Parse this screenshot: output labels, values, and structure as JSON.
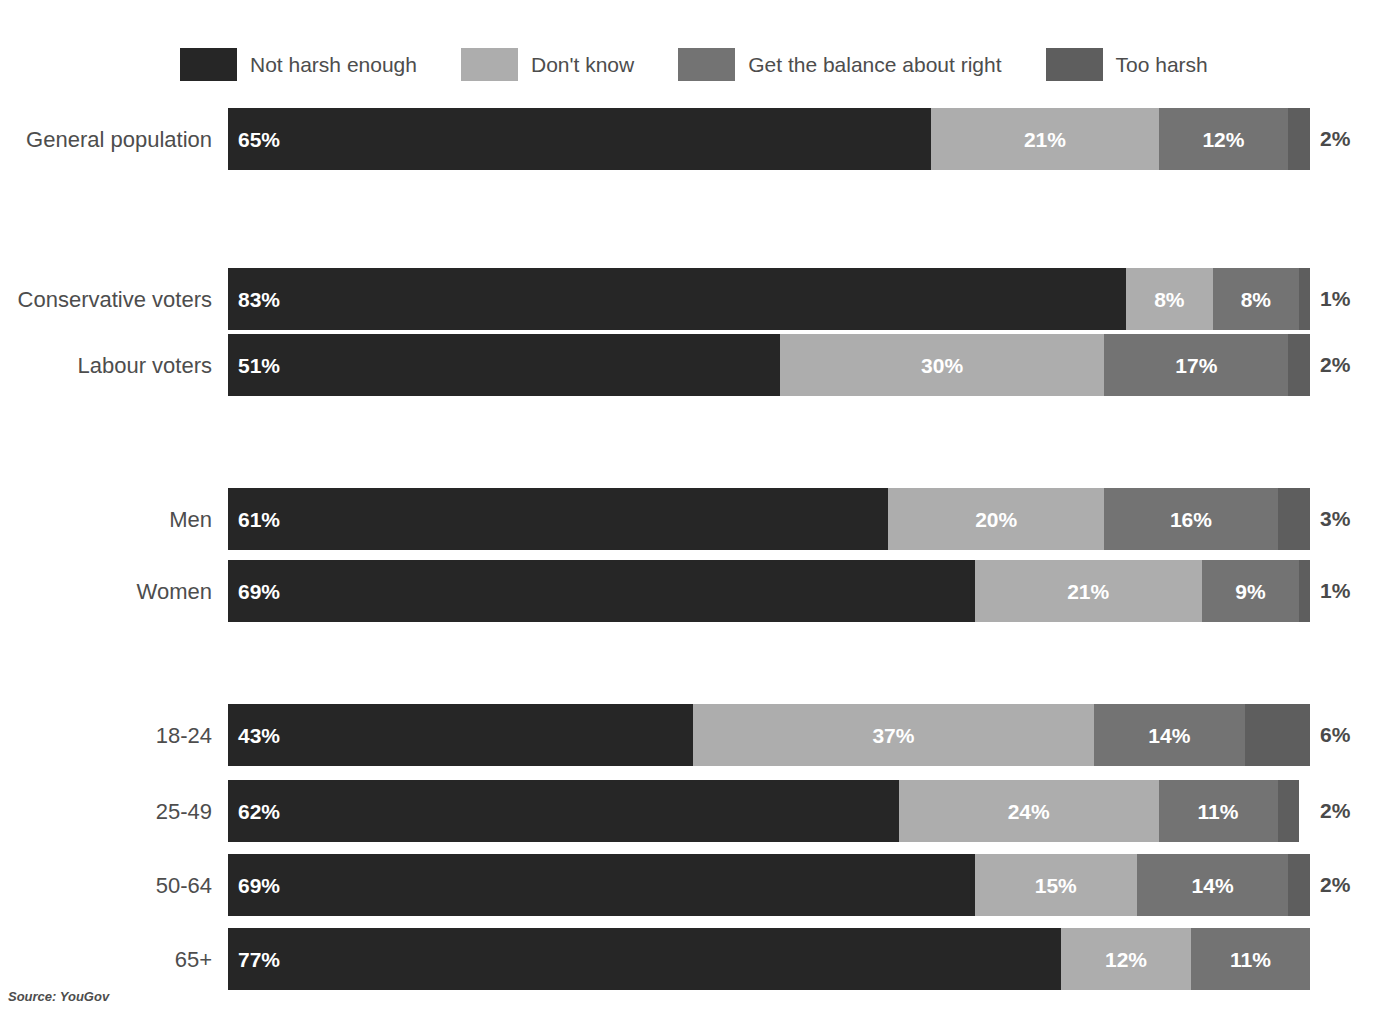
{
  "title": "",
  "source": "Source: YouGov",
  "colors": {
    "not_harsh_enough": "#262626",
    "dont_know": "#adadad",
    "get_the_balance_about_right": "#737373",
    "too_harsh": "#5e5e5e",
    "label_text": "#4d4d4d",
    "inside_label_text": "#ffffff",
    "background": "#ffffff"
  },
  "legend": {
    "items": [
      {
        "label": "Not harsh enough",
        "color": "#262626"
      },
      {
        "label": "Don't know",
        "color": "#adadad"
      },
      {
        "label": "Get the balance about right",
        "color": "#737373"
      },
      {
        "label": "Too harsh",
        "color": "#5e5e5e"
      }
    ]
  },
  "chart_data": {
    "type": "bar",
    "orientation": "horizontal",
    "stacked": true,
    "stack_mode": "percent",
    "title": "",
    "xlabel": "",
    "ylabel": "",
    "xlim": [
      0,
      100
    ],
    "grid": false,
    "legend_position": "top",
    "source": "Source: YouGov",
    "categories": [
      "General population",
      "Conservative voters",
      "Labour voters",
      "Men",
      "Women",
      "18-24",
      "25-49",
      "50-64",
      "65+"
    ],
    "series": [
      {
        "name": "Not harsh enough",
        "color": "#262626",
        "values": [
          65,
          83,
          51,
          61,
          69,
          43,
          62,
          69,
          77
        ]
      },
      {
        "name": "Don't know",
        "color": "#adadad",
        "values": [
          21,
          8,
          30,
          20,
          21,
          37,
          24,
          15,
          12
        ]
      },
      {
        "name": "Get the balance about right",
        "color": "#737373",
        "values": [
          12,
          8,
          17,
          16,
          9,
          14,
          11,
          14,
          11
        ]
      },
      {
        "name": "Too harsh",
        "color": "#5e5e5e",
        "values": [
          2,
          1,
          2,
          3,
          1,
          6,
          2,
          2,
          0
        ]
      }
    ],
    "rows": [
      {
        "category": "General population",
        "segments": [
          {
            "series": "Not harsh enough",
            "value": 65,
            "label": "65%",
            "label_inside": true
          },
          {
            "series": "Don't know",
            "value": 21,
            "label": "21%",
            "label_inside": true
          },
          {
            "series": "Get the balance about right",
            "value": 12,
            "label": "12%",
            "label_inside": true
          },
          {
            "series": "Too harsh",
            "value": 2,
            "label": "2%",
            "label_inside": false
          }
        ]
      },
      {
        "category": "Conservative voters",
        "segments": [
          {
            "series": "Not harsh enough",
            "value": 83,
            "label": "83%",
            "label_inside": true
          },
          {
            "series": "Don't know",
            "value": 8,
            "label": "8%",
            "label_inside": true
          },
          {
            "series": "Get the balance about right",
            "value": 8,
            "label": "8%",
            "label_inside": true
          },
          {
            "series": "Too harsh",
            "value": 1,
            "label": "1%",
            "label_inside": false
          }
        ]
      },
      {
        "category": "Labour voters",
        "segments": [
          {
            "series": "Not harsh enough",
            "value": 51,
            "label": "51%",
            "label_inside": true
          },
          {
            "series": "Don't know",
            "value": 30,
            "label": "30%",
            "label_inside": true
          },
          {
            "series": "Get the balance about right",
            "value": 17,
            "label": "17%",
            "label_inside": true
          },
          {
            "series": "Too harsh",
            "value": 2,
            "label": "2%",
            "label_inside": false
          }
        ]
      },
      {
        "category": "Men",
        "segments": [
          {
            "series": "Not harsh enough",
            "value": 61,
            "label": "61%",
            "label_inside": true
          },
          {
            "series": "Don't know",
            "value": 20,
            "label": "20%",
            "label_inside": true
          },
          {
            "series": "Get the balance about right",
            "value": 16,
            "label": "16%",
            "label_inside": true
          },
          {
            "series": "Too harsh",
            "value": 3,
            "label": "3%",
            "label_inside": false
          }
        ]
      },
      {
        "category": "Women",
        "segments": [
          {
            "series": "Not harsh enough",
            "value": 69,
            "label": "69%",
            "label_inside": true
          },
          {
            "series": "Don't know",
            "value": 21,
            "label": "21%",
            "label_inside": true
          },
          {
            "series": "Get the balance about right",
            "value": 9,
            "label": "9%",
            "label_inside": true
          },
          {
            "series": "Too harsh",
            "value": 1,
            "label": "1%",
            "label_inside": false
          }
        ]
      },
      {
        "category": "18-24",
        "segments": [
          {
            "series": "Not harsh enough",
            "value": 43,
            "label": "43%",
            "label_inside": true
          },
          {
            "series": "Don't know",
            "value": 37,
            "label": "37%",
            "label_inside": true
          },
          {
            "series": "Get the balance about right",
            "value": 14,
            "label": "14%",
            "label_inside": true
          },
          {
            "series": "Too harsh",
            "value": 6,
            "label": "6%",
            "label_inside": false
          }
        ]
      },
      {
        "category": "25-49",
        "segments": [
          {
            "series": "Not harsh enough",
            "value": 62,
            "label": "62%",
            "label_inside": true
          },
          {
            "series": "Don't know",
            "value": 24,
            "label": "24%",
            "label_inside": true
          },
          {
            "series": "Get the balance about right",
            "value": 11,
            "label": "11%",
            "label_inside": true
          },
          {
            "series": "Too harsh",
            "value": 2,
            "label": "2%",
            "label_inside": false
          }
        ]
      },
      {
        "category": "50-64",
        "segments": [
          {
            "series": "Not harsh enough",
            "value": 69,
            "label": "69%",
            "label_inside": true
          },
          {
            "series": "Don't know",
            "value": 15,
            "label": "15%",
            "label_inside": true
          },
          {
            "series": "Get the balance about right",
            "value": 14,
            "label": "14%",
            "label_inside": true
          },
          {
            "series": "Too harsh",
            "value": 2,
            "label": "2%",
            "label_inside": false
          }
        ]
      },
      {
        "category": "65+",
        "segments": [
          {
            "series": "Not harsh enough",
            "value": 77,
            "label": "77%",
            "label_inside": true
          },
          {
            "series": "Don't know",
            "value": 12,
            "label": "12%",
            "label_inside": true
          },
          {
            "series": "Get the balance about right",
            "value": 11,
            "label": "11%",
            "label_inside": true
          }
        ]
      }
    ]
  },
  "layout": {
    "bar_left_px": 228,
    "bar_width_px": 1082,
    "bar_height_px": 62,
    "outside_label_left_px": 1320,
    "row_tops_px": [
      108,
      268,
      334,
      488,
      560,
      704,
      780,
      854,
      928
    ]
  }
}
